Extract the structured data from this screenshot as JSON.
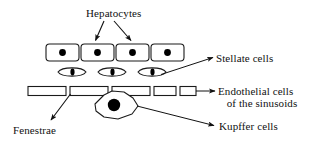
{
  "diagram": {
    "background_color": "#ffffff",
    "stroke_color": "#1a1a1a",
    "nucleus_color": "#000000",
    "labels": {
      "hepatocytes": "Hepatocytes",
      "stellate_cells": "Stellate cells",
      "endothelial_cells_line1": "Endothelial cells",
      "endothelial_cells_line2": "of the sinusoids",
      "kupffer_cells": "Kupffer cells",
      "fenestrae": "Fenestrae"
    },
    "structures": {
      "hepatocyte_row": {
        "name": "hepatocytes",
        "count": 4,
        "shape": "rounded-rectangle-with-nucleus",
        "boxes": [
          {
            "x": 46,
            "y": 44,
            "w": 33,
            "h": 17,
            "nucleus_cx": 62.5,
            "nucleus_cy": 52.5,
            "nucleus_r": 3.4
          },
          {
            "x": 81,
            "y": 44,
            "w": 33,
            "h": 17,
            "nucleus_cx": 97.5,
            "nucleus_cy": 52.5,
            "nucleus_r": 3.4
          },
          {
            "x": 116,
            "y": 44,
            "w": 33,
            "h": 17,
            "nucleus_cx": 132.5,
            "nucleus_cy": 52.5,
            "nucleus_r": 3.4
          },
          {
            "x": 151,
            "y": 44,
            "w": 33,
            "h": 17,
            "nucleus_cx": 167.5,
            "nucleus_cy": 52.5,
            "nucleus_r": 3.4
          }
        ]
      },
      "stellate_row": {
        "name": "stellate-cells",
        "count": 3,
        "shape": "lens-with-dark-nucleus",
        "cells": [
          {
            "cx": 72,
            "cy": 72,
            "rx": 14,
            "ry": 5.5
          },
          {
            "cx": 112,
            "cy": 72,
            "rx": 14,
            "ry": 5.5
          },
          {
            "cx": 152,
            "cy": 72,
            "rx": 14,
            "ry": 5.5
          }
        ]
      },
      "endothelial_row": {
        "name": "endothelial-cells",
        "count": 5,
        "shape": "flat-rectangle",
        "boxes": [
          {
            "x": 28,
            "y": 86,
            "w": 38,
            "h": 9
          },
          {
            "x": 70,
            "y": 86,
            "w": 38,
            "h": 9
          },
          {
            "x": 112,
            "y": 86,
            "w": 38,
            "h": 9
          },
          {
            "x": 154,
            "y": 86,
            "w": 38,
            "h": 9
          },
          {
            "x": 174,
            "y": 86,
            "w": 38,
            "h": 9
          }
        ],
        "gaps_are": "fenestrae"
      },
      "kupffer_cell": {
        "name": "kupffer-cell",
        "shape": "irregular-amoeboid",
        "nucleus_cx": 114,
        "nucleus_cy": 105,
        "nucleus_r": 6.2
      }
    },
    "arrows": [
      {
        "name": "arrow-hepatocytes-left",
        "from": [
          103,
          22
        ],
        "to": [
          95,
          42
        ]
      },
      {
        "name": "arrow-hepatocytes-right",
        "from": [
          115,
          22
        ],
        "to": [
          132,
          42
        ]
      },
      {
        "name": "arrow-stellate",
        "from": [
          160,
          74
        ],
        "to": [
          214,
          58
        ]
      },
      {
        "name": "arrow-endothelial",
        "from": [
          196,
          91
        ],
        "to": [
          216,
          91
        ]
      },
      {
        "name": "arrow-kupffer",
        "from": [
          137,
          106
        ],
        "to": [
          215,
          126
        ]
      },
      {
        "name": "arrow-fenestrae",
        "from": [
          70,
          93
        ],
        "to": [
          50,
          120
        ]
      }
    ]
  }
}
